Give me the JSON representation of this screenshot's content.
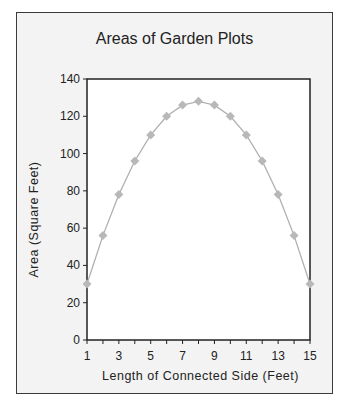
{
  "chart_data": {
    "type": "line",
    "title": "Areas of Garden Plots",
    "xlabel": "Length of Connected Side (Feet)",
    "ylabel": "Area (Square Feet)",
    "x": [
      1,
      2,
      3,
      4,
      5,
      6,
      7,
      8,
      9,
      10,
      11,
      12,
      13,
      14,
      15
    ],
    "series": [
      {
        "name": "Area",
        "values": [
          30,
          56,
          78,
          96,
          110,
          120,
          126,
          128,
          126,
          120,
          110,
          96,
          78,
          56,
          30
        ]
      }
    ],
    "x_tick_labels": [
      "1",
      "3",
      "5",
      "7",
      "9",
      "11",
      "13",
      "15"
    ],
    "y_tick_labels": [
      "0",
      "20",
      "40",
      "60",
      "80",
      "100",
      "120",
      "140"
    ],
    "xlim": [
      1,
      15
    ],
    "ylim": [
      0,
      140
    ],
    "grid": false,
    "legend": null,
    "colors": {
      "line": "#b0b0b0",
      "marker": "#b8b8b8",
      "frame": "#3a3a3a",
      "background": "#f3f3f3",
      "plot_area": "#ffffff"
    }
  }
}
